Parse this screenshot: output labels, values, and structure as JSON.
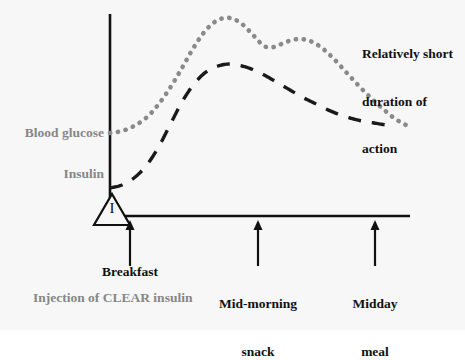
{
  "figure": {
    "background_color": "#f7f7f7",
    "axis_color": "#111111",
    "glucose_color": "#8a8a8a",
    "insulin_color": "#1a1a1a",
    "gray_label_color": "#878787",
    "black_label_color": "#111111"
  },
  "labels": {
    "blood_glucose": "Blood glucose",
    "insulin": "Insulin",
    "injection_note": "Injection of CLEAR insulin",
    "injection_marker": "I",
    "duration_note_line1": "Relatively short",
    "duration_note_line2": "duration of",
    "duration_note_line3": "action",
    "breakfast": "Breakfast",
    "mid_morning_line1": "Mid-morning",
    "mid_morning_line2": "snack",
    "midday_line1": "Midday",
    "midday_line2": "meal"
  },
  "chart_data": {
    "type": "line",
    "title": "",
    "xlabel": "",
    "ylabel": "",
    "grid": false,
    "legend_position": "inline-left",
    "xlim": [
      0,
      465
    ],
    "ylim": [
      0,
      330
    ],
    "axes": {
      "y_axis_x": 110,
      "y_axis_top": 14,
      "y_axis_bottom": 217,
      "x_axis_y": 216,
      "x_axis_left": 110,
      "x_axis_right": 410
    },
    "annotations": [
      {
        "name": "injection-triangle",
        "x": 110,
        "y": 216,
        "label": "I",
        "shape": "triangle"
      },
      {
        "name": "arrow-breakfast",
        "x": 130,
        "y_from": 266,
        "y_to": 222,
        "label": "Breakfast"
      },
      {
        "name": "arrow-mid-morning",
        "x": 258,
        "y_from": 266,
        "y_to": 222,
        "label": "Mid-morning snack"
      },
      {
        "name": "arrow-midday",
        "x": 375,
        "y_from": 266,
        "y_to": 222,
        "label": "Midday meal"
      }
    ],
    "series": [
      {
        "name": "Blood glucose",
        "style": "dotted",
        "color": "#8a8a8a",
        "points": [
          [
            110,
            133
          ],
          [
            122,
            131
          ],
          [
            134,
            126
          ],
          [
            146,
            118
          ],
          [
            158,
            105
          ],
          [
            170,
            88
          ],
          [
            182,
            68
          ],
          [
            194,
            47
          ],
          [
            206,
            30
          ],
          [
            218,
            20
          ],
          [
            230,
            18
          ],
          [
            242,
            24
          ],
          [
            254,
            36
          ],
          [
            264,
            46
          ],
          [
            274,
            47
          ],
          [
            286,
            42
          ],
          [
            298,
            39
          ],
          [
            310,
            41
          ],
          [
            322,
            48
          ],
          [
            334,
            59
          ],
          [
            346,
            72
          ],
          [
            358,
            85
          ],
          [
            370,
            97
          ],
          [
            382,
            108
          ],
          [
            394,
            118
          ],
          [
            406,
            125
          ],
          [
            412,
            127
          ]
        ]
      },
      {
        "name": "Insulin",
        "style": "dashed",
        "color": "#1a1a1a",
        "points": [
          [
            110,
            188
          ],
          [
            122,
            185
          ],
          [
            134,
            178
          ],
          [
            146,
            166
          ],
          [
            158,
            148
          ],
          [
            170,
            125
          ],
          [
            182,
            102
          ],
          [
            194,
            84
          ],
          [
            206,
            72
          ],
          [
            218,
            66
          ],
          [
            230,
            64
          ],
          [
            242,
            66
          ],
          [
            254,
            70
          ],
          [
            266,
            76
          ],
          [
            278,
            83
          ],
          [
            290,
            90
          ],
          [
            302,
            97
          ],
          [
            314,
            103
          ],
          [
            326,
            109
          ],
          [
            338,
            114
          ],
          [
            350,
            118
          ],
          [
            362,
            121
          ],
          [
            374,
            123
          ],
          [
            386,
            125
          ],
          [
            392,
            126
          ]
        ]
      }
    ]
  }
}
